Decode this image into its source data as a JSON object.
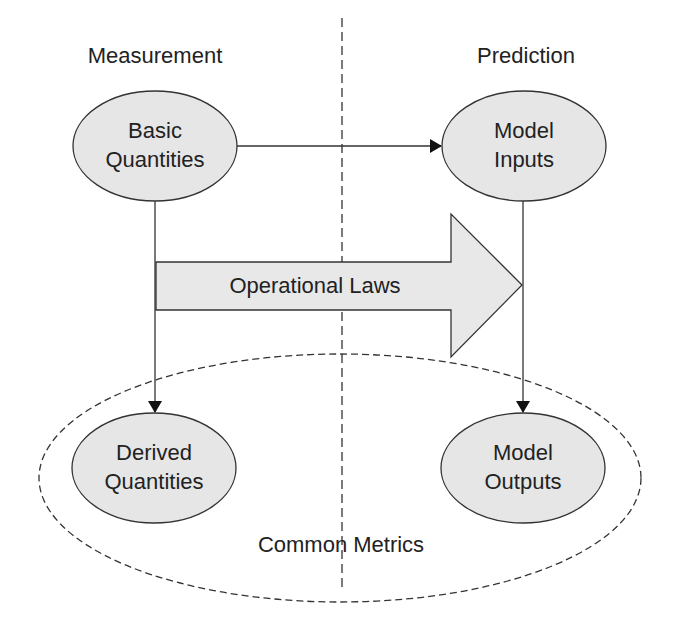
{
  "diagram": {
    "sections": {
      "left": "Measurement",
      "right": "Prediction"
    },
    "nodes": {
      "basic_quantities": {
        "line1": "Basic",
        "line2": "Quantities"
      },
      "model_inputs": {
        "line1": "Model",
        "line2": "Inputs"
      },
      "derived_quantities": {
        "line1": "Derived",
        "line2": "Quantities"
      },
      "model_outputs": {
        "line1": "Model",
        "line2": "Outputs"
      }
    },
    "big_arrow_label": "Operational Laws",
    "group_label": "Common Metrics",
    "edges": [
      {
        "from": "Basic Quantities",
        "to": "Model Inputs"
      },
      {
        "from": "Basic Quantities",
        "to": "Derived Quantities"
      },
      {
        "from": "Model Inputs",
        "to": "Model Outputs"
      },
      {
        "from": "Basic Quantities",
        "to": "Model Inputs",
        "via": "Operational Laws"
      }
    ],
    "colors": {
      "node_fill": "#e6e6e6",
      "stroke": "#333333",
      "text": "#222222",
      "background": "#ffffff"
    }
  }
}
